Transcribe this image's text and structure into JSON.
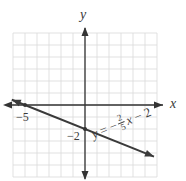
{
  "chart_data": {
    "type": "line",
    "title": "",
    "xlabel": "x",
    "ylabel": "y",
    "xlim": [
      -6,
      6
    ],
    "ylim": [
      -6,
      6
    ],
    "grid": true,
    "grid_step": 1,
    "series": [
      {
        "name": "y = -2/5 x - 2",
        "slope": -0.4,
        "intercept": -2,
        "x": [
          -6.1,
          -5,
          0,
          5.75
        ],
        "y": [
          0.44,
          0,
          -2,
          -4.3
        ],
        "color": "#3a3a3a",
        "arrows": "both"
      }
    ],
    "annotations": [
      {
        "text": "−5",
        "at": [
          -5,
          0
        ],
        "meaning": "x-intercept"
      },
      {
        "text": "−2",
        "at": [
          0,
          -2
        ],
        "meaning": "y-intercept"
      }
    ],
    "equation": {
      "lhs": "y",
      "eq": "=",
      "sign": "−",
      "frac_num": "2",
      "frac_den": "5",
      "var": "x",
      "tail": "− 2"
    }
  },
  "labels": {
    "x_axis": "x",
    "y_axis": "y",
    "x_intercept": "−5",
    "y_intercept": "−2"
  },
  "colors": {
    "grid": "#d9d9d9",
    "axis": "#333333",
    "line": "#3a3a3a",
    "background": "#ffffff"
  }
}
